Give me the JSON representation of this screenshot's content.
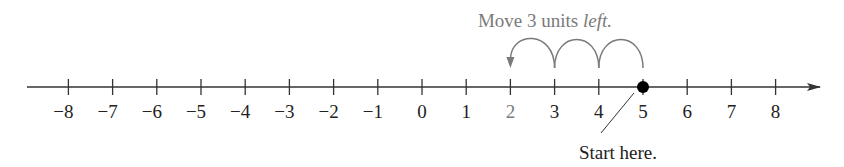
{
  "diagram": {
    "type": "number-line",
    "annotation_top": {
      "text_plain": "Move 3 units ",
      "text_italic": "left.",
      "color": "#7a7a7a"
    },
    "annotation_bottom": {
      "text": "Start here.",
      "color": "#222222"
    },
    "axis": {
      "min": -8,
      "max": 8,
      "tick_labels": [
        "−8",
        "−7",
        "−6",
        "−5",
        "−4",
        "−3",
        "−2",
        "−1",
        "0",
        "1",
        "2",
        "3",
        "4",
        "5",
        "6",
        "7",
        "8"
      ],
      "direction_arrow": "right",
      "color": "#333333"
    },
    "start_point": {
      "value": 5,
      "marker": "filled-dot",
      "color": "#000000"
    },
    "end_point": {
      "value": 2,
      "label_color": "#7a7a7a"
    },
    "jumps": [
      {
        "from": 5,
        "to": 4
      },
      {
        "from": 4,
        "to": 3
      },
      {
        "from": 3,
        "to": 2
      }
    ],
    "jump_color": "#7a7a7a",
    "icons": {
      "arrowhead": "arrowhead-left-icon",
      "axis_arrow": "arrow-right-icon",
      "dot": "filled-circle-icon"
    }
  }
}
